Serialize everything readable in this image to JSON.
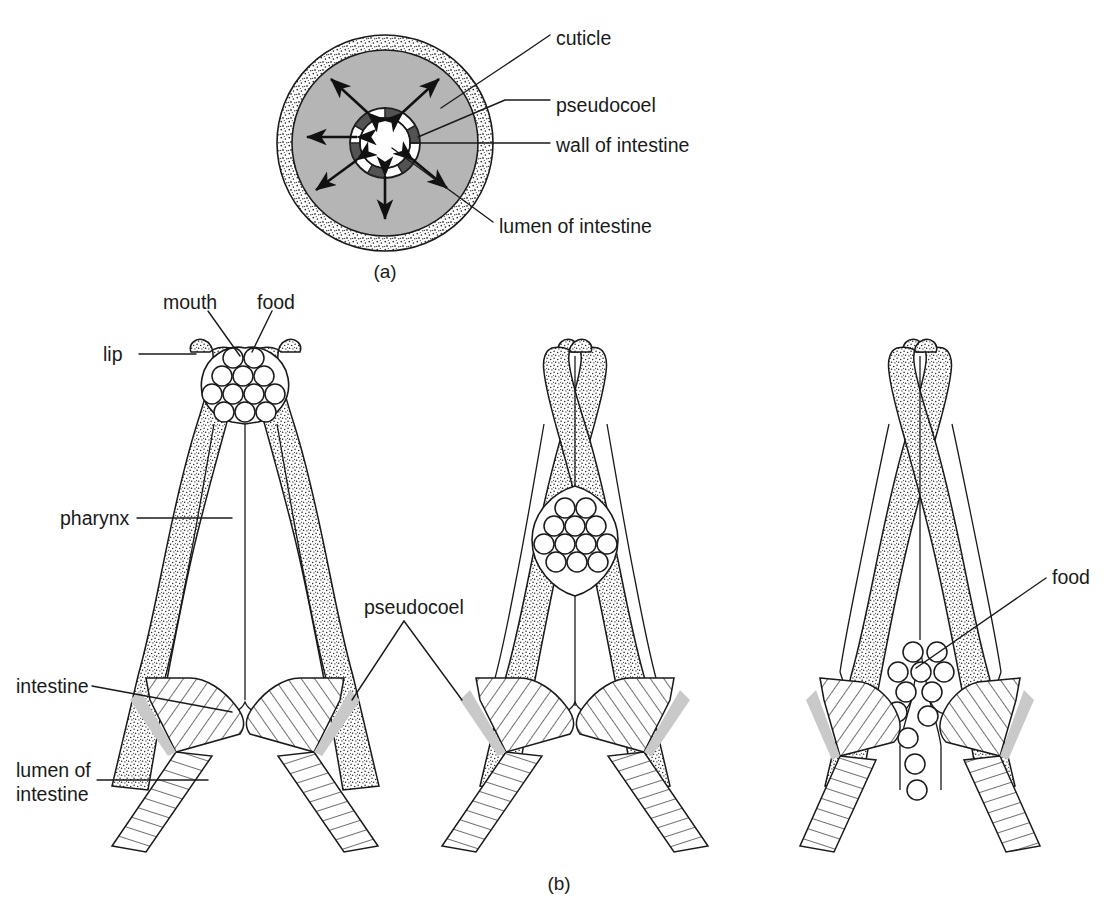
{
  "figure": {
    "panels": [
      {
        "id": "a",
        "caption": "(a)",
        "caption_x": 385,
        "caption_y": 272
      },
      {
        "id": "b",
        "caption": "(b)",
        "caption_x": 559,
        "caption_y": 884
      }
    ]
  },
  "colors": {
    "ink": "#1a1a1a",
    "pseudocoel_gray": "#b5b5b5",
    "cuticle_stipple_base": "#ffffff",
    "paper": "#ffffff",
    "wedge_gray": "#c9c9c9"
  },
  "panel_a": {
    "center": {
      "cx": 385,
      "cy": 143
    },
    "radii": {
      "cuticle_outer": 108,
      "cuticle_inner": 93,
      "pseudocoel_outer": 93,
      "intestine_wall_outer": 35,
      "intestine_wall_inner": 25
    },
    "labels": [
      {
        "key": "cuticle",
        "text": "cuticle",
        "x": 556,
        "y": 39,
        "anchor": "start"
      },
      {
        "key": "pseudocoel",
        "text": "pseudocoel",
        "x": 556,
        "y": 106,
        "anchor": "start"
      },
      {
        "key": "wall_of_intestine",
        "text": "wall of intestine",
        "x": 556,
        "y": 149,
        "anchor": "start"
      },
      {
        "key": "lumen_of_intestine",
        "text": "lumen of intestine",
        "x": 499,
        "y": 228,
        "anchor": "start"
      }
    ],
    "arrow_count": 6,
    "arrow_note": "six double-headed arrows radiating from intestine wall to pseudocoel margin"
  },
  "panel_b": {
    "labels": [
      {
        "key": "mouth",
        "text": "mouth",
        "x": 163,
        "y": 303,
        "anchor": "start"
      },
      {
        "key": "food_top",
        "text": "food",
        "x": 257,
        "y": 303,
        "anchor": "start"
      },
      {
        "key": "lip",
        "text": "lip",
        "x": 103,
        "y": 360,
        "anchor": "start"
      },
      {
        "key": "pharynx",
        "text": "pharynx",
        "x": 60,
        "y": 524,
        "anchor": "start"
      },
      {
        "key": "pseudocoel",
        "text": "pseudocoel",
        "x": 364,
        "y": 613,
        "anchor": "start"
      },
      {
        "key": "intestine",
        "text": "intestine",
        "x": 16,
        "y": 692,
        "anchor": "start"
      },
      {
        "key": "lumen_of",
        "text": "lumen of",
        "x": 16,
        "y": 776,
        "anchor": "start"
      },
      {
        "key": "intestine_2",
        "text": "intestine",
        "x": 16,
        "y": 800,
        "anchor": "start"
      },
      {
        "key": "food_right",
        "text": "food",
        "x": 1052,
        "y": 583,
        "anchor": "start"
      }
    ],
    "stages": [
      {
        "index": 1,
        "name": "mouth-open-food-entering",
        "center_x": 245,
        "description": "Lips open, food mass held in buccal cavity at the mouth",
        "food_circle_count": 12,
        "food_position": "mouth"
      },
      {
        "index": 2,
        "name": "food-bolus-mid-pharynx",
        "center_x": 575,
        "description": "Mouth closed, food bolus compressed within the pharyngeal lumen",
        "food_circle_count": 12,
        "food_position": "mid-pharynx"
      },
      {
        "index": 3,
        "name": "food-released-into-intestine",
        "center_x": 920,
        "description": "Pharynx relaxed, food passing into the lumen of the intestine",
        "food_circle_count": 12,
        "food_position": "intestine-entrance"
      }
    ]
  },
  "legend_note": {
    "cuticle_pattern": "stippled",
    "pseudocoel_pattern": "solid gray / open",
    "intestine_pattern": "diagonal hatching",
    "lumen_pattern": "white"
  }
}
